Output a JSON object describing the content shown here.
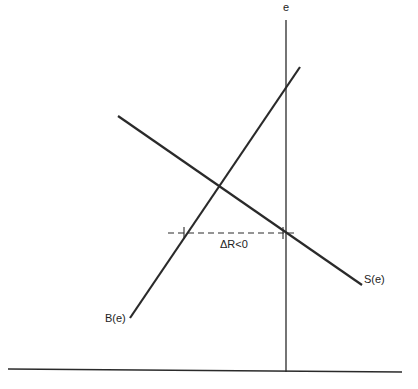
{
  "diagram": {
    "axis_label_vertical": "e",
    "curves": [
      {
        "name": "B(e)",
        "label": "B(e)",
        "description": "upward-sloping line"
      },
      {
        "name": "S(e)",
        "label": "S(e)",
        "description": "downward-sloping line"
      }
    ],
    "annotation": "ΔR<0",
    "colors": {
      "line": "#2a2a2a",
      "background": "#ffffff"
    }
  }
}
